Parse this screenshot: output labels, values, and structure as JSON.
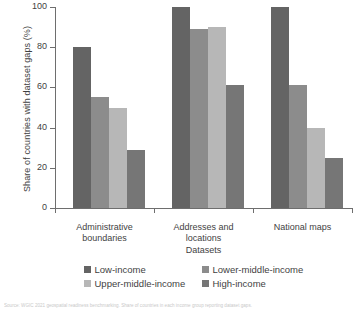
{
  "chart_data": {
    "type": "bar",
    "title": "",
    "xlabel": "Datasets",
    "ylabel": "Share of countries with dataset gaps (%)",
    "ylim": [
      0,
      100
    ],
    "yticks": [
      0,
      20,
      40,
      60,
      80,
      100
    ],
    "grid": false,
    "legend_position": "bottom",
    "categories": [
      "Administrative boundaries",
      "Addresses and locations",
      "National maps"
    ],
    "category_lines": [
      [
        "Administrative",
        "boundaries"
      ],
      [
        "Addresses and",
        "locations"
      ],
      [
        "National maps"
      ]
    ],
    "series": [
      {
        "name": "Low-income",
        "color": "#646464",
        "values": [
          80,
          100,
          100
        ]
      },
      {
        "name": "Lower-middle-income",
        "color": "#8c8c8c",
        "values": [
          55,
          89,
          61
        ]
      },
      {
        "name": "Upper-middle-income",
        "color": "#b7b7b7",
        "values": [
          50,
          90,
          40
        ]
      },
      {
        "name": "High-income",
        "color": "#767676",
        "values": [
          29,
          61,
          25
        ]
      }
    ]
  },
  "source": {
    "note": "Source: WGIC 2021 geospatial readiness benchmarking. Share of countries in each income group reporting dataset gaps."
  }
}
